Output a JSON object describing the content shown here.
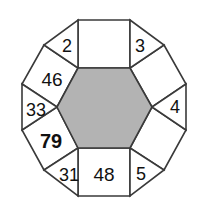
{
  "figure": {
    "name": "hexagon-number-puzzle",
    "colors": {
      "center_fill": "#b3b3b3",
      "cell_fill": "#ffffff",
      "stroke": "#3a3a3a",
      "text": "#111111",
      "background": "#ffffff"
    },
    "center": {
      "shape": "hexagon",
      "label": "",
      "shaded": true
    },
    "squares": [
      {
        "id": "square-top",
        "position": "top",
        "label": "",
        "bold": false
      },
      {
        "id": "square-upper-right",
        "position": "upper-right",
        "label": "",
        "bold": false
      },
      {
        "id": "square-lower-right",
        "position": "lower-right",
        "label": "",
        "bold": false
      },
      {
        "id": "square-bottom",
        "position": "bottom",
        "label": "48",
        "bold": false
      },
      {
        "id": "square-lower-left",
        "position": "lower-left",
        "label": "79",
        "bold": true
      },
      {
        "id": "square-upper-left",
        "position": "upper-left",
        "label": "46",
        "bold": false
      }
    ],
    "triangles": [
      {
        "id": "triangle-top-right",
        "position": "top-right",
        "label": "3"
      },
      {
        "id": "triangle-right",
        "position": "right",
        "label": "4"
      },
      {
        "id": "triangle-bottom-right",
        "position": "bottom-right",
        "label": "5"
      },
      {
        "id": "triangle-bottom-left",
        "position": "bottom-left",
        "label": "31"
      },
      {
        "id": "triangle-left",
        "position": "left",
        "label": "33"
      },
      {
        "id": "triangle-top-left",
        "position": "top-left",
        "label": "2"
      }
    ]
  }
}
